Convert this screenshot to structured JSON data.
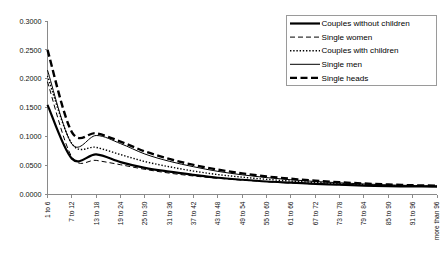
{
  "chart_data": {
    "type": "line",
    "title": "",
    "subtitle": "",
    "xlabel": "",
    "ylabel": "",
    "grid": false,
    "legend_position": "top-right",
    "ylim": [
      0.0,
      0.3
    ],
    "yticks": [
      "0.0000",
      "0.0500",
      "0.1000",
      "0.1500",
      "0.2000",
      "0.2500",
      "0.3000"
    ],
    "ytick_values": [
      0.0,
      0.05,
      0.1,
      0.15,
      0.2,
      0.25,
      0.3
    ],
    "categories": [
      "1 to 6",
      "7 to 12",
      "13 to 18",
      "19 to 24",
      "25 to 30",
      "31 to 36",
      "37 to 42",
      "43 to 48",
      "49 to 54",
      "55 to 60",
      "61 to 66",
      "67 to 72",
      "73 to 78",
      "79 to 84",
      "85 to 90",
      "91 to 96",
      "more than 96"
    ],
    "series": [
      {
        "name": "Couples without children",
        "style": "solid-thick",
        "color": "#000000",
        "values": [
          0.155,
          0.062,
          0.0695,
          0.056,
          0.046,
          0.0395,
          0.034,
          0.029,
          0.0255,
          0.0225,
          0.0205,
          0.0185,
          0.017,
          0.0155,
          0.0145,
          0.014,
          0.0135
        ]
      },
      {
        "name": "Single women",
        "style": "dashed",
        "color": "#000000",
        "values": [
          0.195,
          0.065,
          0.059,
          0.0515,
          0.0435,
          0.037,
          0.032,
          0.028,
          0.0248,
          0.0222,
          0.02,
          0.0182,
          0.0168,
          0.0155,
          0.0146,
          0.014,
          0.0136
        ]
      },
      {
        "name": "Couples with children",
        "style": "dotted",
        "color": "#000000",
        "values": [
          0.205,
          0.088,
          0.0815,
          0.069,
          0.057,
          0.048,
          0.0405,
          0.0345,
          0.03,
          0.0262,
          0.0232,
          0.0208,
          0.0188,
          0.017,
          0.0156,
          0.0148,
          0.0142
        ]
      },
      {
        "name": "Single men",
        "style": "solid-thin",
        "color": "#000000",
        "values": [
          0.215,
          0.0875,
          0.102,
          0.088,
          0.07,
          0.0575,
          0.048,
          0.04,
          0.034,
          0.0292,
          0.0255,
          0.0225,
          0.0202,
          0.0182,
          0.0166,
          0.0155,
          0.0148
        ]
      },
      {
        "name": "Single heads",
        "style": "dashed-thick",
        "color": "#000000",
        "values": [
          0.25,
          0.108,
          0.106,
          0.0915,
          0.0745,
          0.0615,
          0.0512,
          0.043,
          0.0365,
          0.0312,
          0.0272,
          0.0238,
          0.0212,
          0.019,
          0.0172,
          0.016,
          0.0152
        ]
      }
    ]
  },
  "legend": {
    "items": [
      {
        "label": "Couples without children",
        "style": "solid-thick"
      },
      {
        "label": "Single women",
        "style": "dashed"
      },
      {
        "label": "Couples with children",
        "style": "dotted"
      },
      {
        "label": "Single men",
        "style": "solid-thin"
      },
      {
        "label": "Single heads",
        "style": "dashed-thick"
      }
    ]
  }
}
